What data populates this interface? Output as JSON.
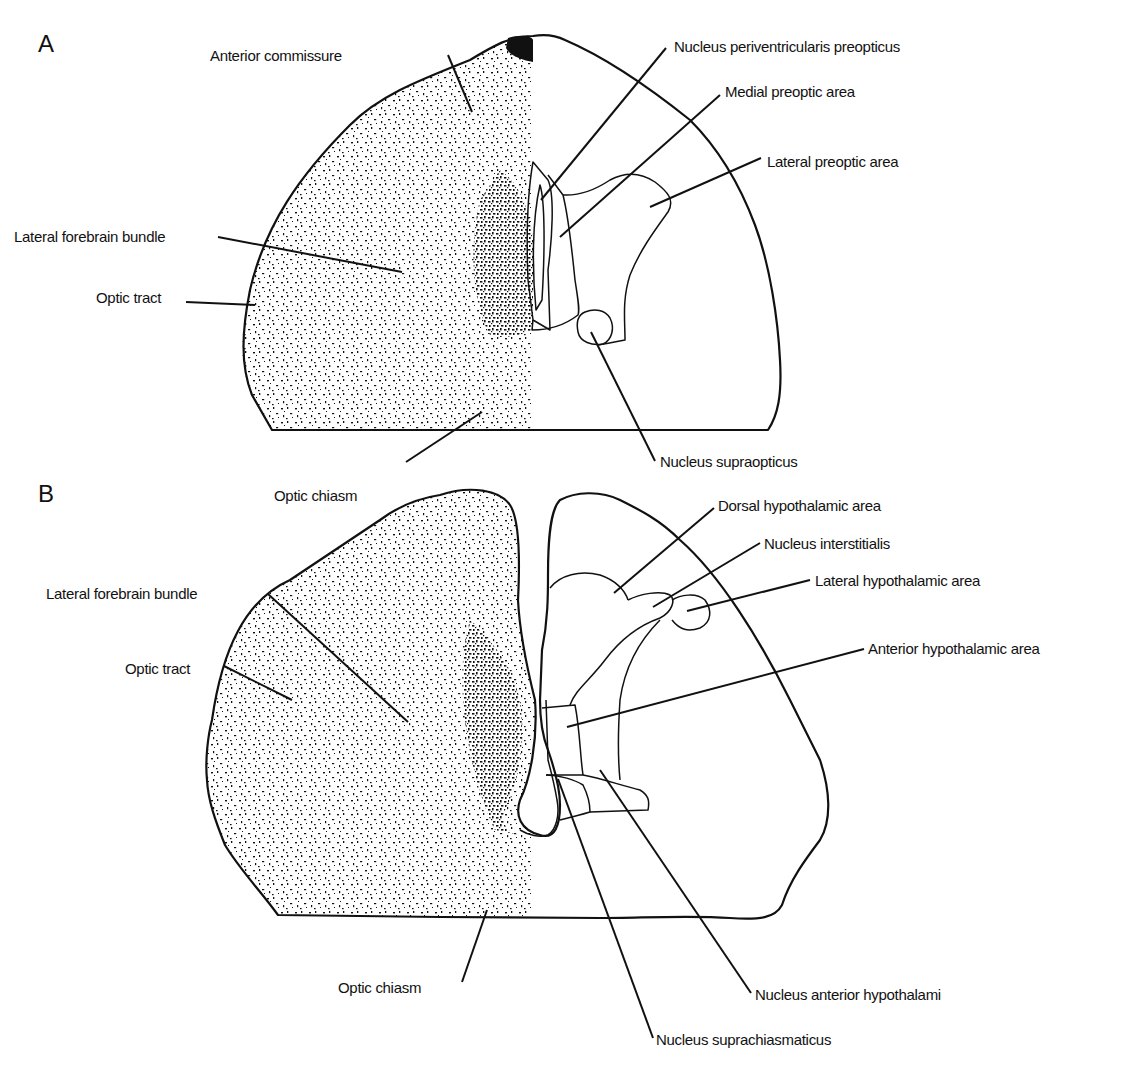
{
  "figure": {
    "panels": [
      {
        "id": "A",
        "label": "A",
        "labels": {
          "anterior_commissure": "Anterior commissure",
          "lateral_forebrain_bundle": "Lateral forebrain bundle",
          "optic_tract": "Optic tract",
          "optic_chiasm": "Optic chiasm",
          "nucleus_periventricularis_preopticus": "Nucleus periventricularis preopticus",
          "medial_preoptic_area": "Medial preoptic area",
          "lateral_preoptic_area": "Lateral preoptic area",
          "nucleus_supraopticus": "Nucleus supraopticus"
        }
      },
      {
        "id": "B",
        "label": "B",
        "labels": {
          "lateral_forebrain_bundle": "Lateral forebrain bundle",
          "optic_tract": "Optic tract",
          "optic_chiasm": "Optic chiasm",
          "dorsal_hypothalamic_area": "Dorsal hypothalamic area",
          "nucleus_interstitialis": "Nucleus interstitialis",
          "lateral_hypothalamic_area": "Lateral hypothalamic area",
          "anterior_hypothalamic_area": "Anterior hypothalamic area",
          "nucleus_anterior_hypothalami": "Nucleus anterior hypothalami",
          "nucleus_suprachiasmaticus": "Nucleus suprachiasmaticus"
        }
      }
    ],
    "colors": {
      "ink": "#111111",
      "background": "#ffffff"
    }
  }
}
